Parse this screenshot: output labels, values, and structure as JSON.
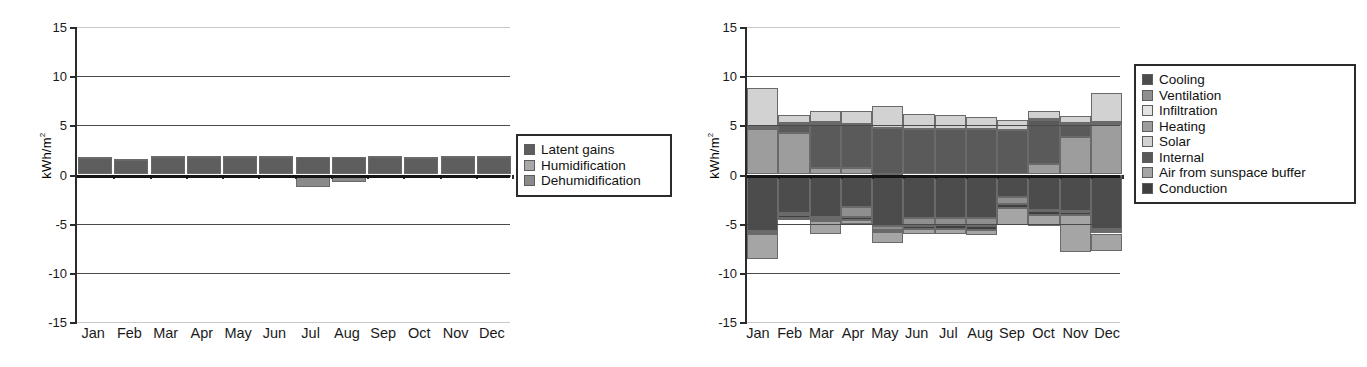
{
  "figure": {
    "background": "#ffffff",
    "panels": [
      "latent-loads-chart",
      "energy-balance-chart"
    ]
  },
  "palette": {
    "latent_gains": "#5e5e5e",
    "humidification": "#a8a8a8",
    "dehumidification": "#8a8a8a",
    "cooling": "#4c4c4c",
    "ventilation": "#8f8f8f",
    "infiltration": "#e3e3e3",
    "heating": "#9d9d9d",
    "solar": "#d2d2d2",
    "internal": "#5a5a5a",
    "air_from_sunspace_buffer": "#a5a5a5",
    "conduction": "#3f3f3f",
    "axis": "#2b2b2b",
    "grid": "#4a4a4a",
    "grid_faint": "#c9c9c9",
    "zero_line": "#141414"
  },
  "left_chart": {
    "ylabel_text": "kWh/m",
    "ylabel_exponent": "2",
    "legend": {
      "items": [
        {
          "label": "Latent gains",
          "color_key": "latent_gains"
        },
        {
          "label": "Humidification",
          "color_key": "humidification"
        },
        {
          "label": "Dehumidification",
          "color_key": "dehumidification"
        }
      ]
    }
  },
  "right_chart": {
    "ylabel_text": "kWh/m",
    "ylabel_exponent": "2",
    "legend": {
      "items": [
        {
          "label": "Cooling",
          "color_key": "cooling"
        },
        {
          "label": "Ventilation",
          "color_key": "ventilation"
        },
        {
          "label": "Infiltration",
          "color_key": "infiltration"
        },
        {
          "label": "Heating",
          "color_key": "heating"
        },
        {
          "label": "Solar",
          "color_key": "solar"
        },
        {
          "label": "Internal",
          "color_key": "internal"
        },
        {
          "label": "Air from sunspace buffer",
          "color_key": "air_from_sunspace_buffer"
        },
        {
          "label": "Conduction",
          "color_key": "conduction"
        }
      ]
    }
  },
  "chart_data": [
    {
      "id": "latent-loads-chart",
      "type": "bar",
      "stacked": true,
      "title": "",
      "xlabel": "",
      "ylabel": "kWh/m2",
      "ylim": [
        -15,
        15
      ],
      "yticks": [
        15,
        10,
        5,
        0,
        -5,
        -10,
        -15
      ],
      "grid": true,
      "legend_position": "right",
      "categories": [
        "Jan",
        "Feb",
        "Mar",
        "Apr",
        "May",
        "Jun",
        "Jul",
        "Aug",
        "Sep",
        "Oct",
        "Nov",
        "Dec"
      ],
      "series": [
        {
          "name": "Latent gains",
          "color": "#5e5e5e",
          "values": [
            1.75,
            1.55,
            1.8,
            1.8,
            1.8,
            1.8,
            1.8,
            1.8,
            1.8,
            1.75,
            1.8,
            1.8
          ]
        },
        {
          "name": "Humidification",
          "color": "#a8a8a8",
          "values": [
            0.05,
            0.05,
            0.05,
            0.05,
            0.05,
            0.05,
            0.0,
            0.0,
            0.05,
            0.05,
            0.05,
            0.05
          ]
        },
        {
          "name": "Dehumidification",
          "color": "#8a8a8a",
          "values": [
            -0.1,
            -0.1,
            -0.1,
            -0.1,
            -0.15,
            -0.35,
            -1.25,
            -0.8,
            -0.25,
            -0.4,
            -0.2,
            -0.15
          ]
        }
      ]
    },
    {
      "id": "energy-balance-chart",
      "type": "bar",
      "stacked": true,
      "title": "",
      "xlabel": "",
      "ylabel": "kWh/m2",
      "ylim": [
        -15,
        15
      ],
      "yticks": [
        15,
        10,
        5,
        0,
        -5,
        -10,
        -15
      ],
      "grid": true,
      "legend_position": "right",
      "categories": [
        "Jan",
        "Feb",
        "Mar",
        "Apr",
        "May",
        "Jun",
        "Jul",
        "Aug",
        "Sep",
        "Oct",
        "Nov",
        "Dec"
      ],
      "series": [
        {
          "name": "Heating",
          "color": "#9d9d9d",
          "values": [
            4.6,
            4.25,
            0.7,
            0.7,
            0.1,
            0.0,
            0.0,
            0.0,
            0.0,
            1.05,
            3.85,
            5.15
          ]
        },
        {
          "name": "Internal",
          "color": "#5a5a5a",
          "values": [
            0.0,
            0.75,
            4.45,
            4.45,
            4.6,
            4.6,
            4.6,
            4.6,
            4.55,
            4.45,
            1.2,
            0.0
          ]
        },
        {
          "name": "Infiltration",
          "color": "#e3e3e3",
          "values": [
            0.25,
            0.2,
            0.15,
            0.0,
            0.0,
            0.0,
            0.0,
            0.0,
            0.0,
            0.15,
            0.2,
            0.2
          ]
        },
        {
          "name": "Solar",
          "color": "#d2d2d2",
          "values": [
            3.95,
            0.85,
            1.15,
            1.3,
            2.25,
            1.55,
            1.5,
            1.2,
            0.95,
            0.85,
            0.75,
            2.95
          ]
        },
        {
          "name": "Cooling",
          "color": "#4c4c4c",
          "values": [
            -5.75,
            -3.95,
            -4.35,
            -3.35,
            -5.2,
            -4.45,
            -4.45,
            -4.4,
            -2.25,
            -3.6,
            -3.7,
            -5.55
          ]
        },
        {
          "name": "Ventilation",
          "color": "#8f8f8f",
          "values": [
            -0.05,
            -0.2,
            -0.15,
            -1.0,
            -0.4,
            -0.75,
            -0.7,
            -0.85,
            -0.75,
            -0.15,
            -0.15,
            -0.15
          ]
        },
        {
          "name": "Conduction",
          "color": "#3f3f3f",
          "values": [
            -0.3,
            -0.25,
            -0.25,
            -0.3,
            -0.25,
            -0.3,
            -0.35,
            -0.35,
            -0.45,
            -0.4,
            -0.3,
            -0.3
          ]
        },
        {
          "name": "Air from sunspace buffer",
          "color": "#a5a5a5",
          "values": [
            -2.5,
            -0.2,
            -1.3,
            -0.35,
            -1.1,
            -0.55,
            -0.6,
            -0.55,
            -1.65,
            -1.1,
            -3.7,
            -1.75
          ]
        }
      ]
    }
  ]
}
